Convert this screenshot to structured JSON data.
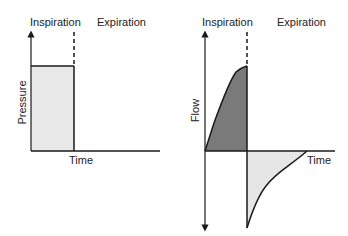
{
  "diagrams": [
    {
      "name": "pressure-waveform",
      "phase_labels": [
        "Inspiration",
        "Expiration"
      ],
      "y_label": "Pressure",
      "x_label": "Time",
      "shape": "square wave (constant pressure during inspiration)"
    },
    {
      "name": "flow-waveform",
      "phase_labels": [
        "Inspiration",
        "Expiration"
      ],
      "y_label": "Flow",
      "x_label": "Time",
      "shape": "inspiratory flow rising (decelerating rise); expiratory flow sharp negative peak with exponential decay"
    }
  ],
  "colors": {
    "line": "#1a1a1a",
    "pressure_fill": "#e8e8e8",
    "insp_flow_fill": "#7a7a7a",
    "exp_flow_fill": "#e6e6e6"
  }
}
